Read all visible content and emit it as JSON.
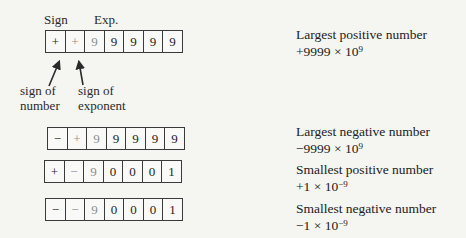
{
  "colors": {
    "paper": "#f5f5f2",
    "ink": "#242424",
    "faded_ink": "#8f8f8f",
    "box_border": "#3b3b3b"
  },
  "labels": {
    "sign": "Sign",
    "exp": "Exp.",
    "sign_of_number_line1": "sign of",
    "sign_of_number_line2": "number",
    "sign_of_exponent_line1": "sign of",
    "sign_of_exponent_line2": "exponent"
  },
  "registers": [
    {
      "cells": [
        "+",
        "+",
        "9",
        "9",
        "9",
        "9",
        "9"
      ]
    },
    {
      "cells": [
        "−",
        "+",
        "9",
        "9",
        "9",
        "9",
        "9"
      ]
    },
    {
      "cells": [
        "+",
        "−",
        "9",
        "0",
        "0",
        "0",
        "1"
      ]
    },
    {
      "cells": [
        "−",
        "−",
        "9",
        "0",
        "0",
        "0",
        "1"
      ]
    }
  ],
  "descriptions": [
    {
      "title": "Largest positive number",
      "value_base": "+9999 × 10",
      "value_exp": "9"
    },
    {
      "title": "Largest negative number",
      "value_base": "−9999 × 10",
      "value_exp": "9"
    },
    {
      "title": "Smallest positive number",
      "value_base": "+1 × 10",
      "value_exp": "−9"
    },
    {
      "title": "Smallest negative number",
      "value_base": "−1 × 10",
      "value_exp": "−9"
    }
  ]
}
